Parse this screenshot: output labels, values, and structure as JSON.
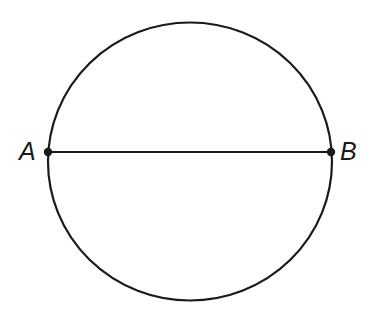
{
  "figure": {
    "kind": "geometry-diagram",
    "background_color": "#ffffff",
    "stroke_color": "#1a1a1a",
    "canvas": {
      "width": 369,
      "height": 323
    },
    "circle": {
      "name": "circle-outline",
      "center_x": 190,
      "center_y": 161.5,
      "radius_x": 142,
      "radius_y": 139,
      "stroke_width": 2.2,
      "fill": "none"
    },
    "chord": {
      "name": "chord-ab",
      "x1": 48,
      "y1": 152,
      "x2": 331,
      "y2": 152,
      "stroke_width": 2.2
    },
    "points": [
      {
        "name": "point-a",
        "label": "A",
        "cx": 48,
        "cy": 152,
        "radius": 4.2,
        "label_x": 19,
        "label_y": 139
      },
      {
        "name": "point-b",
        "label": "B",
        "cx": 331,
        "cy": 152,
        "radius": 4.2,
        "label_x": 340,
        "label_y": 139
      }
    ]
  }
}
